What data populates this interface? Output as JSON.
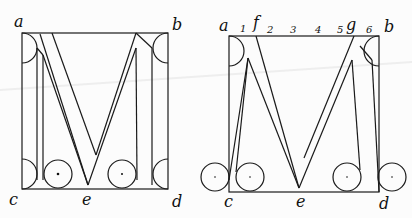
{
  "figure_left": {
    "corners": {
      "a": "a",
      "b": "b",
      "c": "c",
      "d": "d"
    },
    "bottom_mid": "e"
  },
  "figure_right": {
    "corners": {
      "a": "a",
      "b": "b",
      "c": "c",
      "d": "d"
    },
    "bottom_mid": "e",
    "top_marks": [
      "1",
      "2",
      "3",
      "4",
      "5",
      "6"
    ],
    "top_letters": {
      "f": "f",
      "g": "g"
    }
  },
  "colors": {
    "ink": "#1a1a1a",
    "paper": "#fcfcfc"
  }
}
